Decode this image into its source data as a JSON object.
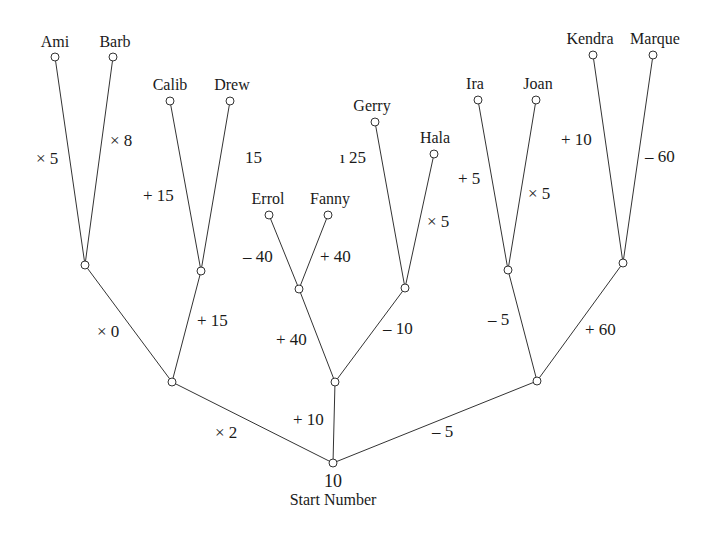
{
  "diagram": {
    "root": {
      "value": "10",
      "caption": "Start Number",
      "x": 333,
      "y": 463
    },
    "nodes": [
      {
        "id": "root",
        "x": 333,
        "y": 463
      },
      {
        "id": "L1",
        "x": 172,
        "y": 382
      },
      {
        "id": "M1",
        "x": 335,
        "y": 382
      },
      {
        "id": "R1",
        "x": 537,
        "y": 381
      },
      {
        "id": "LA",
        "x": 85,
        "y": 265
      },
      {
        "id": "LB",
        "x": 201,
        "y": 271
      },
      {
        "id": "MA",
        "x": 299,
        "y": 289
      },
      {
        "id": "MB",
        "x": 405,
        "y": 288
      },
      {
        "id": "RA",
        "x": 508,
        "y": 270
      },
      {
        "id": "RB",
        "x": 623,
        "y": 263
      },
      {
        "id": "Ami",
        "x": 55,
        "y": 57
      },
      {
        "id": "Barb",
        "x": 113,
        "y": 57
      },
      {
        "id": "Calib",
        "x": 170,
        "y": 101
      },
      {
        "id": "Drew",
        "x": 230,
        "y": 101
      },
      {
        "id": "Errol",
        "x": 269,
        "y": 215
      },
      {
        "id": "Fanny",
        "x": 328,
        "y": 215
      },
      {
        "id": "Gerry",
        "x": 375,
        "y": 122
      },
      {
        "id": "Hala",
        "x": 434,
        "y": 154
      },
      {
        "id": "Ira",
        "x": 478,
        "y": 100
      },
      {
        "id": "Joan",
        "x": 536,
        "y": 100
      },
      {
        "id": "Kendra",
        "x": 593,
        "y": 55
      },
      {
        "id": "Marque",
        "x": 653,
        "y": 55
      }
    ],
    "edges": [
      {
        "from": "root",
        "to": "L1",
        "op": "× 2",
        "lx": 215,
        "ly": 432
      },
      {
        "from": "root",
        "to": "M1",
        "op": "+ 10",
        "lx": 293,
        "ly": 419
      },
      {
        "from": "root",
        "to": "R1",
        "op": "– 5",
        "lx": 432,
        "ly": 431
      },
      {
        "from": "L1",
        "to": "LA",
        "op": "× 0",
        "lx": 97,
        "ly": 331
      },
      {
        "from": "L1",
        "to": "LB",
        "op": "+ 15",
        "lx": 197,
        "ly": 320
      },
      {
        "from": "M1",
        "to": "MA",
        "op": "+ 40",
        "lx": 276,
        "ly": 339
      },
      {
        "from": "M1",
        "to": "MB",
        "op": "– 10",
        "lx": 383,
        "ly": 328
      },
      {
        "from": "R1",
        "to": "RA",
        "op": "– 5",
        "lx": 488,
        "ly": 319
      },
      {
        "from": "R1",
        "to": "RB",
        "op": "+ 60",
        "lx": 585,
        "ly": 329
      },
      {
        "from": "LA",
        "to": "Ami",
        "op": "× 5",
        "lx": 36,
        "ly": 158
      },
      {
        "from": "LA",
        "to": "Barb",
        "op": "× 8",
        "lx": 110,
        "ly": 140
      },
      {
        "from": "LB",
        "to": "Calib",
        "op": "+ 15",
        "lx": 143,
        "ly": 195
      },
      {
        "from": "LB",
        "to": "Drew",
        "op": "15",
        "lx": 245,
        "ly": 157
      },
      {
        "from": "MA",
        "to": "Errol",
        "op": "– 40",
        "lx": 243,
        "ly": 256
      },
      {
        "from": "MA",
        "to": "Fanny",
        "op": "+ 40",
        "lx": 320,
        "ly": 256
      },
      {
        "from": "MB",
        "to": "Gerry",
        "op": "ı 25",
        "lx": 340,
        "ly": 157
      },
      {
        "from": "MB",
        "to": "Hala",
        "op": "× 5",
        "lx": 427,
        "ly": 221
      },
      {
        "from": "RA",
        "to": "Ira",
        "op": "+ 5",
        "lx": 458,
        "ly": 178
      },
      {
        "from": "RA",
        "to": "Joan",
        "op": "× 5",
        "lx": 528,
        "ly": 193
      },
      {
        "from": "RB",
        "to": "Kendra",
        "op": "+ 10",
        "lx": 561,
        "ly": 139
      },
      {
        "from": "RB",
        "to": "Marque",
        "op": "– 60",
        "lx": 645,
        "ly": 156
      }
    ],
    "leaves": [
      {
        "name": "Ami",
        "x": 55,
        "y": 50
      },
      {
        "name": "Barb",
        "x": 115,
        "y": 50
      },
      {
        "name": "Calib",
        "x": 170,
        "y": 93
      },
      {
        "name": "Drew",
        "x": 232,
        "y": 93
      },
      {
        "name": "Errol",
        "x": 268,
        "y": 207
      },
      {
        "name": "Fanny",
        "x": 330,
        "y": 207
      },
      {
        "name": "Gerry",
        "x": 372,
        "y": 114
      },
      {
        "name": "Hala",
        "x": 435,
        "y": 146
      },
      {
        "name": "Ira",
        "x": 475,
        "y": 92
      },
      {
        "name": "Joan",
        "x": 538,
        "y": 92
      },
      {
        "name": "Kendra",
        "x": 590,
        "y": 47
      },
      {
        "name": "Marque",
        "x": 655,
        "y": 47
      }
    ]
  }
}
